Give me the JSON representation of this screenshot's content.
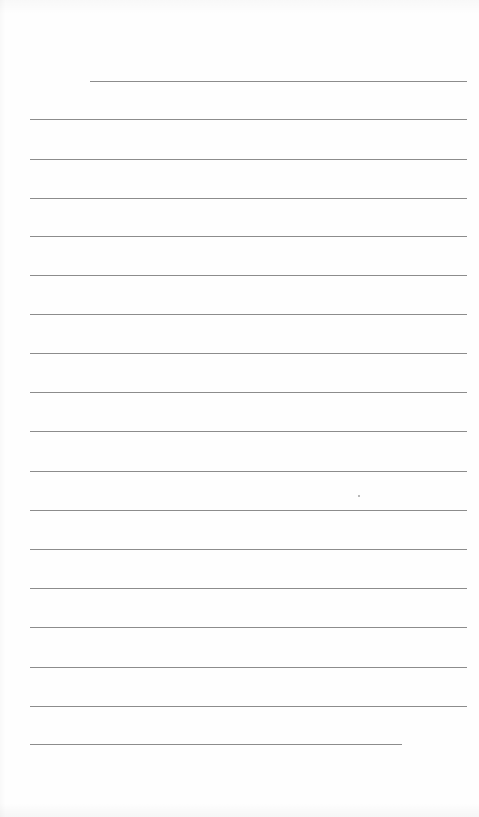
{
  "page": {
    "type": "lined-paper",
    "background_color": "#fefefe",
    "rule_color": "#8c8c8c",
    "text": []
  },
  "rules": [
    {
      "y": 81,
      "x1": 90,
      "x2": 467
    },
    {
      "y": 119,
      "x1": 30,
      "x2": 467
    },
    {
      "y": 159,
      "x1": 30,
      "x2": 467
    },
    {
      "y": 198,
      "x1": 30,
      "x2": 467
    },
    {
      "y": 236,
      "x1": 30,
      "x2": 467
    },
    {
      "y": 275,
      "x1": 30,
      "x2": 467
    },
    {
      "y": 314,
      "x1": 30,
      "x2": 467
    },
    {
      "y": 353,
      "x1": 30,
      "x2": 467
    },
    {
      "y": 392,
      "x1": 30,
      "x2": 467
    },
    {
      "y": 431,
      "x1": 30,
      "x2": 467
    },
    {
      "y": 471,
      "x1": 30,
      "x2": 467
    },
    {
      "y": 510,
      "x1": 30,
      "x2": 467
    },
    {
      "y": 549,
      "x1": 30,
      "x2": 467
    },
    {
      "y": 588,
      "x1": 30,
      "x2": 467
    },
    {
      "y": 627,
      "x1": 30,
      "x2": 467
    },
    {
      "y": 667,
      "x1": 30,
      "x2": 467
    },
    {
      "y": 706,
      "x1": 30,
      "x2": 467
    },
    {
      "y": 744,
      "x1": 30,
      "x2": 402
    }
  ],
  "specks": [
    {
      "x": 358,
      "y": 495
    }
  ]
}
